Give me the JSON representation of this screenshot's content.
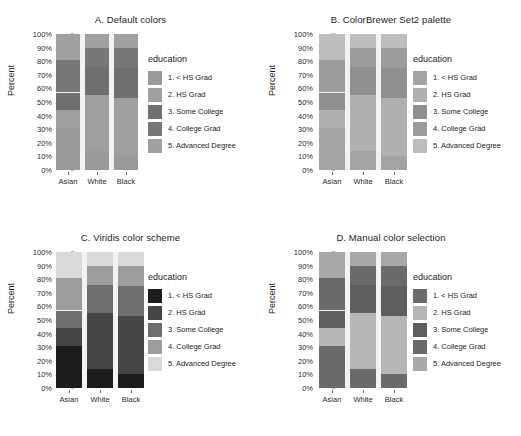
{
  "figure": {
    "panels": [
      {
        "id": "A",
        "title": "A. Default colors",
        "legend_title": "education",
        "legend_x": 148,
        "legend_label_clip": 108,
        "bars_left": 56,
        "bar_width": 24,
        "bar_gap": 5,
        "colors": [
          "#9a9a9a",
          "#9f9f9f",
          "#6f6f6f",
          "#777777",
          "#a0a0a0"
        ]
      },
      {
        "id": "B",
        "title": "B. ColorBrewer Set2 palette",
        "legend_title": "education",
        "legend_x": 152,
        "legend_label_clip": 104,
        "bars_left": 58,
        "bar_width": 26,
        "bar_gap": 5,
        "colors": [
          "#a3a3a3",
          "#b0b0b0",
          "#8f8f8f",
          "#9c9c9c",
          "#bdbdbd"
        ]
      },
      {
        "id": "C",
        "title": "C. Viridis color scheme",
        "legend_title": "education",
        "legend_x": 148,
        "legend_label_clip": 110,
        "bars_left": 56,
        "bar_width": 26,
        "bar_gap": 5,
        "colors": [
          "#1c1c1c",
          "#454545",
          "#6e6e6e",
          "#9d9d9d",
          "#d9d9d9"
        ]
      },
      {
        "id": "D",
        "title": "D. Manual color selection",
        "legend_title": "education",
        "legend_x": 152,
        "legend_label_clip": 104,
        "bars_left": 58,
        "bar_width": 26,
        "bar_gap": 5,
        "colors": [
          "#6b6b6b",
          "#b6b6b6",
          "#5e5e5e",
          "#6b6b6b",
          "#a8a8a8"
        ]
      }
    ]
  },
  "chart_data": {
    "type": "bar",
    "subtype": "stacked-percent",
    "xlabel": "",
    "ylabel": "Percent",
    "ylim": [
      0,
      100
    ],
    "ytick_labels": [
      "0%",
      "10%",
      "20%",
      "30%",
      "40%",
      "50%",
      "60%",
      "70%",
      "80%",
      "90%",
      "100%"
    ],
    "ytick_values": [
      0,
      10,
      20,
      30,
      40,
      50,
      60,
      70,
      80,
      90,
      100
    ],
    "grid": false,
    "legend_position": "right",
    "legend_title": "education",
    "categories": [
      "Asian",
      "White",
      "Black"
    ],
    "series": [
      {
        "name": "1. < HS Grad",
        "values": [
          31,
          14,
          10
        ]
      },
      {
        "name": "2. HS Grad",
        "values": [
          13,
          41,
          43
        ]
      },
      {
        "name": "3. Some College",
        "values": [
          13,
          21,
          22
        ]
      },
      {
        "name": "4. College Grad",
        "values": [
          24,
          14,
          15
        ]
      },
      {
        "name": "5. Advanced Degree",
        "values": [
          19,
          10,
          10
        ]
      }
    ],
    "legend_entries": [
      "1. < HS Grad",
      "2. HS Grad",
      "3. Some College",
      "4. College Grad",
      "5. Advanced Degree"
    ],
    "panel_titles": [
      "A. Default colors",
      "B. ColorBrewer Set2 palette",
      "C. Viridis color scheme",
      "D. Manual color selection"
    ]
  }
}
